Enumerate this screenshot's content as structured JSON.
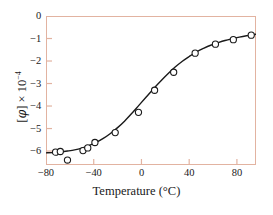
{
  "chart_data": {
    "type": "scatter",
    "title": "",
    "subtitle": "",
    "xlabel": "Temperature (°C)",
    "ylabel": "[φ] × 10⁻⁴",
    "ylabel_parts": {
      "bracket_open": "[",
      "symbol": "φ",
      "bracket_close": "]",
      "times": "×",
      "base": "10",
      "exponent": "−4"
    },
    "xlim": [
      -80,
      96
    ],
    "ylim": [
      -6.62,
      0
    ],
    "grid": false,
    "legend": null,
    "xticks": [
      -80,
      -40,
      0,
      40,
      80
    ],
    "xtick_labels": [
      "−80",
      "−40",
      "0",
      "40",
      "80"
    ],
    "yticks": [
      0,
      -1,
      -2,
      -3,
      -4,
      -5,
      -6
    ],
    "ytick_labels": [
      "0",
      "−1",
      "−2",
      "−3",
      "−4",
      "−5",
      "−6"
    ],
    "marker_style": "open-circle",
    "marker_edge_color": "#1a1a1a",
    "marker_face_color": "#ffffff",
    "curve_color": "#1a1a1a",
    "frame_color": "#e2b3a1",
    "background_color": "#ffffff",
    "x": [
      -72,
      -68,
      -62,
      -49,
      -45,
      -39,
      -22,
      -2.5,
      11,
      27,
      45,
      62,
      77,
      92
    ],
    "y": [
      -6.05,
      -6.02,
      -6.4,
      -5.98,
      -5.86,
      -5.62,
      -5.18,
      -4.28,
      -3.3,
      -2.5,
      -1.65,
      -1.25,
      -1.05,
      -0.85
    ],
    "series": [
      {
        "name": "measured",
        "points": [
          {
            "x": -72,
            "y": -6.05
          },
          {
            "x": -68,
            "y": -6.02
          },
          {
            "x": -62,
            "y": -6.4
          },
          {
            "x": -49,
            "y": -5.98
          },
          {
            "x": -45,
            "y": -5.86
          },
          {
            "x": -39,
            "y": -5.62
          },
          {
            "x": -22,
            "y": -5.18
          },
          {
            "x": -2.5,
            "y": -4.28
          },
          {
            "x": 11,
            "y": -3.3
          },
          {
            "x": 27,
            "y": -2.5
          },
          {
            "x": 45,
            "y": -1.65
          },
          {
            "x": 62,
            "y": -1.25
          },
          {
            "x": 77,
            "y": -1.05
          },
          {
            "x": 92,
            "y": -0.85
          }
        ]
      }
    ],
    "fit_curve": [
      {
        "x": -80,
        "y": -6.08
      },
      {
        "x": -74,
        "y": -6.07
      },
      {
        "x": -68,
        "y": -6.04
      },
      {
        "x": -62,
        "y": -6.0
      },
      {
        "x": -56,
        "y": -5.95
      },
      {
        "x": -50,
        "y": -5.87
      },
      {
        "x": -44,
        "y": -5.76
      },
      {
        "x": -38,
        "y": -5.62
      },
      {
        "x": -32,
        "y": -5.44
      },
      {
        "x": -26,
        "y": -5.22
      },
      {
        "x": -20,
        "y": -4.96
      },
      {
        "x": -14,
        "y": -4.66
      },
      {
        "x": -8,
        "y": -4.32
      },
      {
        "x": -2,
        "y": -3.96
      },
      {
        "x": 4,
        "y": -3.6
      },
      {
        "x": 10,
        "y": -3.24
      },
      {
        "x": 16,
        "y": -2.9
      },
      {
        "x": 22,
        "y": -2.58
      },
      {
        "x": 28,
        "y": -2.28
      },
      {
        "x": 34,
        "y": -2.02
      },
      {
        "x": 40,
        "y": -1.8
      },
      {
        "x": 46,
        "y": -1.6
      },
      {
        "x": 52,
        "y": -1.44
      },
      {
        "x": 58,
        "y": -1.3
      },
      {
        "x": 64,
        "y": -1.19
      },
      {
        "x": 70,
        "y": -1.09
      },
      {
        "x": 76,
        "y": -1.01
      },
      {
        "x": 82,
        "y": -0.94
      },
      {
        "x": 88,
        "y": -0.88
      },
      {
        "x": 96,
        "y": -0.81
      }
    ]
  }
}
